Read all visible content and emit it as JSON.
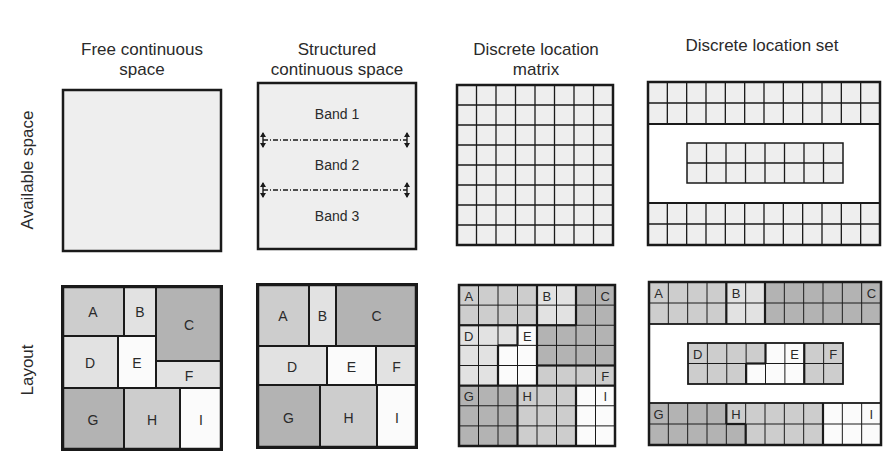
{
  "column_titles": [
    {
      "text": "Free continuous\nspace",
      "cx": 142,
      "top": 40
    },
    {
      "text": "Structured\ncontinuous space",
      "cx": 337,
      "top": 40
    },
    {
      "text": "Discrete location\nmatrix",
      "cx": 536,
      "top": 40
    },
    {
      "text": "Discrete location set",
      "cx": 762,
      "top": 36
    }
  ],
  "row_labels": [
    {
      "text": "Available space",
      "cx": 28,
      "cy": 170
    },
    {
      "text": "Layout",
      "cx": 28,
      "cy": 370
    }
  ],
  "colors": {
    "border": "#1a1a1a",
    "empty": "#eeeeee",
    "white": "#fbfbfb",
    "light": "#e2e2e2",
    "mid": "#cdcdcd",
    "dark": "#b3b3b3"
  },
  "available_space": {
    "free": {
      "x": 62,
      "y": 89,
      "w": 160,
      "h": 163
    },
    "structured": {
      "x": 257,
      "y": 82,
      "w": 160,
      "h": 168,
      "bands": [
        "Band 1",
        "Band 2",
        "Band 3"
      ],
      "dividers_y": [
        58,
        108
      ]
    },
    "matrix": {
      "x": 456,
      "y": 84,
      "w": 158,
      "h": 162,
      "cols": 8,
      "rows": 8
    },
    "set": {
      "x": 647,
      "y": 81,
      "w": 234,
      "h": 165,
      "top_block": {
        "rows": 2,
        "cols": 12,
        "h": 42
      },
      "mid_block": {
        "x": 40,
        "y": 62,
        "w": 156,
        "h": 40,
        "rows": 2,
        "cols": 8
      },
      "bottom_block": {
        "rows": 2,
        "cols": 12,
        "h": 42
      }
    }
  },
  "layout": {
    "free": {
      "x": 62,
      "y": 286,
      "w": 160,
      "h": 164,
      "blocks": [
        {
          "label": "A",
          "x": 0,
          "y": 0,
          "w": 62,
          "h": 50,
          "shade": "mid"
        },
        {
          "label": "B",
          "x": 62,
          "y": 0,
          "w": 32,
          "h": 50,
          "shade": "light"
        },
        {
          "label": "C",
          "x": 94,
          "y": 0,
          "w": 66,
          "h": 75,
          "shade": "dark"
        },
        {
          "label": "D",
          "x": 0,
          "y": 50,
          "w": 56,
          "h": 52,
          "shade": "light"
        },
        {
          "label": "E",
          "x": 56,
          "y": 50,
          "w": 38,
          "h": 52,
          "shade": "white"
        },
        {
          "label": "F",
          "x": 94,
          "y": 75,
          "w": 66,
          "h": 27,
          "shade": "light"
        },
        {
          "label": "G",
          "x": 0,
          "y": 102,
          "w": 62,
          "h": 62,
          "shade": "dark"
        },
        {
          "label": "H",
          "x": 62,
          "y": 102,
          "w": 56,
          "h": 62,
          "shade": "mid"
        },
        {
          "label": "I",
          "x": 118,
          "y": 102,
          "w": 42,
          "h": 62,
          "shade": "white"
        }
      ]
    },
    "structured": {
      "x": 257,
      "y": 284,
      "w": 160,
      "h": 164,
      "blocks": [
        {
          "label": "A",
          "x": 0,
          "y": 0,
          "w": 52,
          "h": 62,
          "shade": "mid"
        },
        {
          "label": "B",
          "x": 52,
          "y": 0,
          "w": 27,
          "h": 62,
          "shade": "light"
        },
        {
          "label": "C",
          "x": 79,
          "y": 0,
          "w": 81,
          "h": 62,
          "shade": "dark"
        },
        {
          "label": "D",
          "x": 0,
          "y": 62,
          "w": 70,
          "h": 39,
          "shade": "light"
        },
        {
          "label": "E",
          "x": 70,
          "y": 62,
          "w": 49,
          "h": 39,
          "shade": "white"
        },
        {
          "label": "F",
          "x": 119,
          "y": 62,
          "w": 41,
          "h": 39,
          "shade": "light"
        },
        {
          "label": "G",
          "x": 0,
          "y": 101,
          "w": 63,
          "h": 63,
          "shade": "dark"
        },
        {
          "label": "H",
          "x": 63,
          "y": 101,
          "w": 57,
          "h": 63,
          "shade": "mid"
        },
        {
          "label": "I",
          "x": 120,
          "y": 101,
          "w": 40,
          "h": 63,
          "shade": "white"
        }
      ]
    },
    "matrix": {
      "x": 458,
      "y": 284,
      "w": 158,
      "h": 163,
      "cols": 8,
      "rows": 8,
      "cells": [
        "AAAABBCC",
        "AAAABBCC",
        "DDDECCCC",
        "DDEECCCC",
        "DDEEFFFF",
        "GGGHHHII",
        "GGGHHHII",
        "GGGHHHII"
      ],
      "labels": [
        {
          "text": "A",
          "col": 0,
          "row": 0
        },
        {
          "text": "B",
          "col": 4,
          "row": 0
        },
        {
          "text": "C",
          "col": 7,
          "row": 0
        },
        {
          "text": "D",
          "col": 0,
          "row": 2
        },
        {
          "text": "E",
          "col": 3,
          "row": 2
        },
        {
          "text": "F",
          "col": 7,
          "row": 4
        },
        {
          "text": "G",
          "col": 0,
          "row": 5
        },
        {
          "text": "H",
          "col": 3,
          "row": 5
        },
        {
          "text": "I",
          "col": 7,
          "row": 5
        }
      ],
      "shades": {
        "A": "mid",
        "B": "light",
        "C": "dark",
        "D": "light",
        "E": "white",
        "F": "mid",
        "G": "dark",
        "H": "mid",
        "I": "white"
      }
    },
    "set": {
      "x": 648,
      "y": 281,
      "w": 234,
      "h": 165,
      "top": {
        "h": 42,
        "cells": [
          "AAAABBCCCCCC",
          "AAAABBCCCCCC"
        ]
      },
      "mid": {
        "x": 40,
        "y": 62,
        "w": 155,
        "h": 41,
        "cells": [
          "DDDDEEFF",
          "DDDEEEFF"
        ]
      },
      "bottom": {
        "h": 42,
        "cells": [
          "GGGGHHHHHIII",
          "GGGGGHHHHIII"
        ]
      },
      "labels": [
        {
          "text": "A",
          "part": "top",
          "col": 0,
          "row": 0
        },
        {
          "text": "B",
          "part": "top",
          "col": 4,
          "row": 0
        },
        {
          "text": "C",
          "part": "top",
          "col": 11,
          "row": 0
        },
        {
          "text": "D",
          "part": "mid",
          "col": 0,
          "row": 0
        },
        {
          "text": "E",
          "part": "mid",
          "col": 5,
          "row": 0
        },
        {
          "text": "F",
          "part": "mid",
          "col": 7,
          "row": 0
        },
        {
          "text": "G",
          "part": "bottom",
          "col": 0,
          "row": 0
        },
        {
          "text": "H",
          "part": "bottom",
          "col": 4,
          "row": 0
        },
        {
          "text": "I",
          "part": "bottom",
          "col": 11,
          "row": 0
        }
      ],
      "shades": {
        "A": "mid",
        "B": "light",
        "C": "dark",
        "D": "mid",
        "E": "white",
        "F": "mid",
        "G": "dark",
        "H": "mid",
        "I": "white"
      }
    }
  }
}
